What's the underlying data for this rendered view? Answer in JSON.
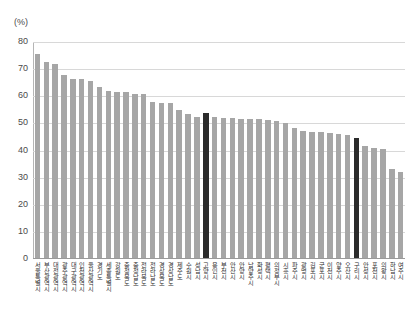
{
  "chart_data": {
    "type": "bar",
    "title": "",
    "subtitle": "",
    "xlabel": "",
    "ylabel": "(%)",
    "unit_label": "(%)",
    "ylim": [
      0,
      80
    ],
    "ytick_step": 10,
    "yticks": [
      "80",
      "70",
      "60",
      "50",
      "40",
      "30",
      "20",
      "10",
      "0"
    ],
    "grid": true,
    "legend": "none",
    "bar_color": "#a6a6a6",
    "highlight_color": "#2b2b2b",
    "highlight_indices": [
      19,
      36
    ],
    "categories": [
      "서울특별시",
      "부산광역시",
      "대전광역시",
      "광주광역시",
      "대구광역시",
      "인천광역시",
      "울산광역시",
      "경기도",
      "세종특별시",
      "강원도",
      "충청북도",
      "충청남도",
      "전라북도",
      "전라남도",
      "경상북도",
      "경상남도",
      "제주도",
      "수원시",
      "성남시",
      "고양시",
      "용인시",
      "부천시",
      "안산시",
      "안양시",
      "남양주시",
      "화성시",
      "평택시",
      "의정부시",
      "시흥시",
      "파주시",
      "광명시",
      "김포시",
      "군포시",
      "이천시",
      "양주시",
      "오산시",
      "구리시",
      "안성시",
      "포천시",
      "의왕시",
      "하남시",
      "여주시"
    ],
    "values": [
      75.5,
      72.8,
      71.8,
      67.8,
      66.5,
      66.2,
      65.5,
      63.5,
      61.8,
      61.4,
      61.4,
      61.0,
      61.0,
      58.0,
      57.6,
      57.4,
      54.8,
      53.6,
      52.4,
      54.0,
      52.2,
      52.1,
      51.9,
      51.8,
      51.6,
      51.5,
      51.2,
      50.8,
      50.0,
      48.2,
      47.3,
      47.0,
      46.8,
      46.6,
      46.2,
      45.8,
      44.6,
      41.5,
      41.0,
      40.4,
      33.1,
      32.0
    ]
  }
}
